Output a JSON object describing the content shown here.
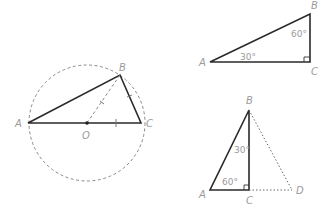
{
  "figures": {
    "circle_figure": {
      "labels": {
        "A": "A",
        "B": "B",
        "C": "C",
        "O": "O"
      },
      "description": "Triangle ABC inscribed in dashed circle with center O on diameter AC; dashed segment OB; tick marks on OB, BC and OC"
    },
    "right_triangle": {
      "labels": {
        "A": "A",
        "B": "B",
        "C": "C"
      },
      "angle_A": "30°",
      "angle_B": "60°",
      "right_angle_at": "C"
    },
    "reflected_triangle": {
      "labels": {
        "A": "A",
        "B": "B",
        "C": "C",
        "D": "D"
      },
      "angle_A": "60°",
      "angle_B": "30°",
      "right_angle_at": "C",
      "description": "Triangle ABC with dotted extension to D forming triangle ABD"
    }
  },
  "colors": {
    "line": "#2a2a2a",
    "dashed": "#8a8a8a",
    "label": "#9a9a9a"
  }
}
